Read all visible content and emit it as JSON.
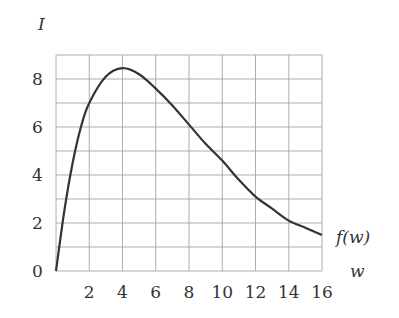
{
  "chart_data": {
    "type": "line",
    "title": "",
    "xlabel": "w",
    "ylabel": "I",
    "curve_label": "f(w)",
    "xlim": [
      0,
      16
    ],
    "ylim": [
      0,
      9
    ],
    "x_ticks": [
      2,
      4,
      6,
      8,
      10,
      12,
      14,
      16
    ],
    "y_ticks": [
      0,
      2,
      4,
      6,
      8
    ],
    "grid": {
      "x_step": 2,
      "y_step": 1,
      "on": true
    },
    "series": [
      {
        "name": "f(w)",
        "x": [
          0,
          0.5,
          1,
          1.5,
          2,
          3,
          4,
          5,
          6,
          7,
          8,
          9,
          10,
          11,
          12,
          13,
          14,
          15,
          16
        ],
        "values": [
          0,
          2.5,
          4.5,
          6.0,
          7.0,
          8.1,
          8.45,
          8.2,
          7.6,
          6.9,
          6.1,
          5.3,
          4.6,
          3.8,
          3.1,
          2.6,
          2.1,
          1.8,
          1.5
        ]
      }
    ]
  },
  "labels": {
    "y_axis": "I",
    "x_axis": "w",
    "curve": "f(w)",
    "y_ticks": [
      "0",
      "2",
      "4",
      "6",
      "8"
    ],
    "x_ticks": [
      "2",
      "4",
      "6",
      "8",
      "10",
      "12",
      "14",
      "16"
    ]
  }
}
